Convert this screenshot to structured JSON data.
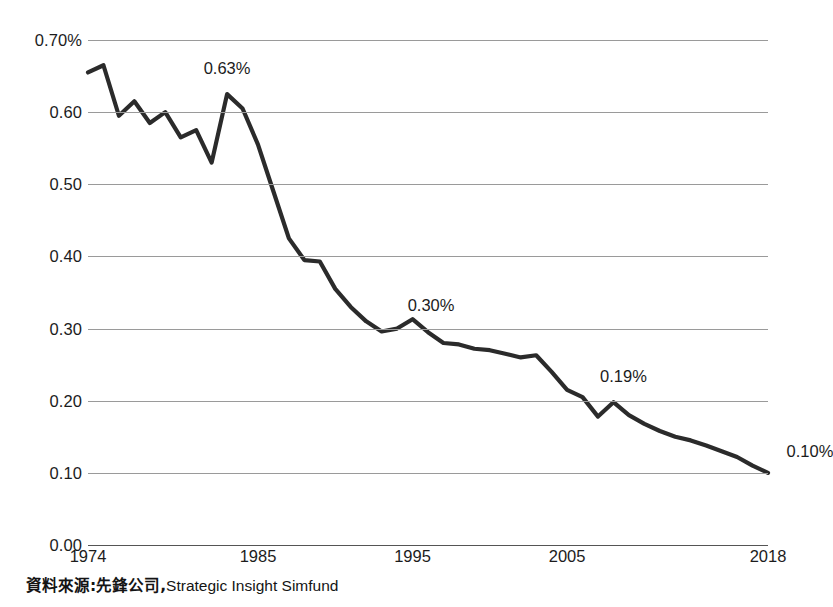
{
  "chart_data": {
    "type": "line",
    "title": "",
    "subtitle": "",
    "xlabel": "",
    "ylabel": "",
    "xlim": [
      1974,
      2018
    ],
    "ylim": [
      0.0,
      0.7
    ],
    "grid": true,
    "legend": "none",
    "y_ticks": [
      "0.70%",
      "0.60",
      "0.50",
      "0.40",
      "0.30",
      "0.20",
      "0.10",
      "0.00"
    ],
    "y_tick_values": [
      0.7,
      0.6,
      0.5,
      0.4,
      0.3,
      0.2,
      0.1,
      0.0
    ],
    "x_ticks": [
      "1974",
      "1985",
      "1995",
      "2005",
      "2018"
    ],
    "x_tick_values": [
      1974,
      1985,
      1995,
      2005,
      2018
    ],
    "x": [
      1974,
      1975,
      1976,
      1977,
      1978,
      1979,
      1980,
      1981,
      1982,
      1983,
      1984,
      1985,
      1986,
      1987,
      1988,
      1989,
      1990,
      1991,
      1992,
      1993,
      1994,
      1995,
      1996,
      1997,
      1998,
      1999,
      2000,
      2001,
      2002,
      2003,
      2004,
      2005,
      2006,
      2007,
      2008,
      2009,
      2010,
      2011,
      2012,
      2013,
      2014,
      2015,
      2016,
      2017,
      2018
    ],
    "values": [
      0.655,
      0.665,
      0.595,
      0.615,
      0.585,
      0.6,
      0.565,
      0.575,
      0.53,
      0.625,
      0.605,
      0.555,
      0.49,
      0.425,
      0.395,
      0.393,
      0.355,
      0.33,
      0.31,
      0.296,
      0.3,
      0.313,
      0.295,
      0.28,
      0.278,
      0.272,
      0.27,
      0.265,
      0.26,
      0.263,
      0.24,
      0.215,
      0.205,
      0.178,
      0.198,
      0.18,
      0.168,
      0.158,
      0.15,
      0.145,
      0.138,
      0.13,
      0.122,
      0.11,
      0.1
    ],
    "series": [
      {
        "name": "Expense ratio",
        "color": "#2b2b2b",
        "values": [
          0.655,
          0.665,
          0.595,
          0.615,
          0.585,
          0.6,
          0.565,
          0.575,
          0.53,
          0.625,
          0.605,
          0.555,
          0.49,
          0.425,
          0.395,
          0.393,
          0.355,
          0.33,
          0.31,
          0.296,
          0.3,
          0.313,
          0.295,
          0.28,
          0.278,
          0.272,
          0.27,
          0.265,
          0.26,
          0.263,
          0.24,
          0.215,
          0.205,
          0.178,
          0.198,
          0.18,
          0.168,
          0.158,
          0.15,
          0.145,
          0.138,
          0.13,
          0.122,
          0.11,
          0.1
        ]
      }
    ],
    "annotations": [
      {
        "label": "0.63%",
        "x": 1983,
        "y": 0.625
      },
      {
        "label": "0.30%",
        "x": 1994,
        "y": 0.3
      },
      {
        "label": "0.19%",
        "x": 2008,
        "y": 0.198
      },
      {
        "label": "0.10%",
        "x": 2018,
        "y": 0.1
      }
    ]
  },
  "source": {
    "cjk_text": "資料來源:先鋒公司,",
    "latin_text": "Strategic Insight Simfund"
  }
}
